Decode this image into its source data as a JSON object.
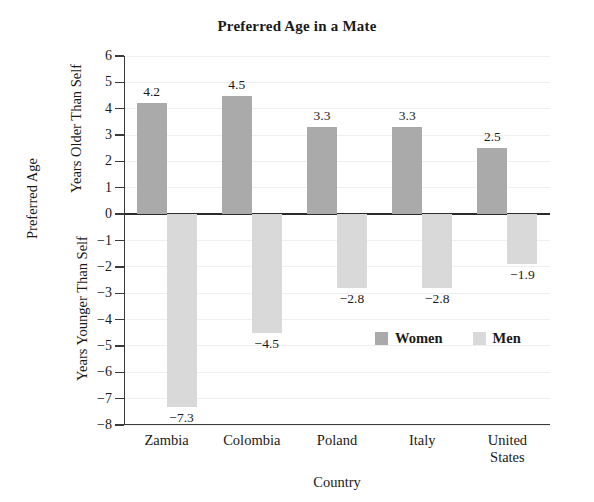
{
  "chart_data": {
    "type": "bar",
    "title": "Preferred Age in a Mate",
    "xlabel": "Country",
    "ylabel": "Preferred Age",
    "ylabel_upper": "Years Older Than Self",
    "ylabel_lower": "Years Younger Than Self",
    "categories": [
      "Zambia",
      "Colombia",
      "Poland",
      "Italy",
      "United States"
    ],
    "category_lines": [
      [
        "Zambia"
      ],
      [
        "Colombia"
      ],
      [
        "Poland"
      ],
      [
        "Italy"
      ],
      [
        "United",
        "States"
      ]
    ],
    "series": [
      {
        "name": "Women",
        "color": "#aaaaaa",
        "values": [
          4.2,
          4.5,
          3.3,
          3.3,
          2.5
        ]
      },
      {
        "name": "Men",
        "color": "#d9d9d9",
        "values": [
          -7.3,
          -4.5,
          -2.8,
          -2.8,
          -1.9
        ]
      }
    ],
    "value_labels": {
      "Women": [
        "4.2",
        "4.5",
        "3.3",
        "3.3",
        "2.5"
      ],
      "Men": [
        "−7.3",
        "−4.5",
        "−2.8",
        "−2.8",
        "−1.9"
      ]
    },
    "ylim": [
      -8,
      6
    ],
    "ytick_values": [
      6,
      5,
      4,
      3,
      2,
      1,
      0,
      -1,
      -2,
      -3,
      -4,
      -5,
      -6,
      -7,
      -8
    ],
    "ytick_labels": [
      "6",
      "5",
      "4",
      "3",
      "2",
      "1",
      "0",
      "−1",
      "−2",
      "−3",
      "−4",
      "−5",
      "−6",
      "−7",
      "−8"
    ],
    "grid": true,
    "legend_position": "inside-lower-right",
    "legend": [
      "Women",
      "Men"
    ]
  }
}
